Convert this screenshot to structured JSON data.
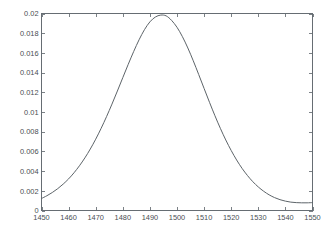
{
  "figure": {
    "background_color": "#ffffff",
    "axes_color": "#666d73",
    "curve_color": "#5d6469",
    "label_color": "#4a4f53"
  },
  "chart_data": {
    "type": "line",
    "title": "",
    "subtitle": "",
    "xlabel": "",
    "ylabel": "",
    "xlim": [
      1450,
      1550
    ],
    "ylim": [
      0,
      0.02
    ],
    "grid": false,
    "legend": null,
    "legend_position": "none",
    "xticks": [
      1450,
      1460,
      1470,
      1480,
      1490,
      1500,
      1510,
      1520,
      1530,
      1540,
      1550
    ],
    "xtick_labels": [
      "1450",
      "1460",
      "1470",
      "1480",
      "1490",
      "1500",
      "1510",
      "1520",
      "1530",
      "1540",
      "1550"
    ],
    "yticks": [
      0,
      0.002,
      0.004,
      0.006,
      0.008,
      0.01,
      0.012,
      0.014,
      0.016,
      0.018,
      0.02
    ],
    "ytick_labels": [
      "0",
      "0.002",
      "0.004",
      "0.006",
      "0.008",
      "0.01",
      "0.012",
      "0.014",
      "0.016",
      "0.018",
      "0.02"
    ],
    "tick_direction": "in",
    "series": [
      {
        "name": "gaussian",
        "peak_x": 1498,
        "peak_y": 0.0193,
        "x": [
          1450,
          1452,
          1454,
          1456,
          1458,
          1460,
          1462,
          1464,
          1466,
          1468,
          1470,
          1472,
          1474,
          1476,
          1478,
          1480,
          1482,
          1484,
          1486,
          1488,
          1490,
          1492,
          1494,
          1496,
          1498,
          1500,
          1502,
          1504,
          1506,
          1508,
          1510,
          1512,
          1514,
          1516,
          1518,
          1520,
          1522,
          1524,
          1526,
          1528,
          1530,
          1532,
          1534,
          1536,
          1538,
          1540,
          1542,
          1544,
          1546,
          1548,
          1550
        ],
        "y": [
          0.00122,
          0.0015,
          0.00183,
          0.00222,
          0.00268,
          0.00321,
          0.00383,
          0.00454,
          0.00534,
          0.00624,
          0.00724,
          0.00834,
          0.00953,
          0.0108,
          0.01213,
          0.01349,
          0.01484,
          0.01613,
          0.01733,
          0.01836,
          0.01915,
          0.01964,
          0.01984,
          0.01976,
          0.0193,
          0.0186,
          0.01765,
          0.0165,
          0.0152,
          0.01381,
          0.01239,
          0.01098,
          0.00962,
          0.00834,
          0.00716,
          0.00609,
          0.00513,
          0.00428,
          0.00355,
          0.00292,
          0.00239,
          0.00195,
          0.00159,
          0.00131,
          0.0011,
          0.00095,
          0.00085,
          0.0008,
          0.00078,
          0.00078,
          0.0008
        ]
      }
    ]
  }
}
